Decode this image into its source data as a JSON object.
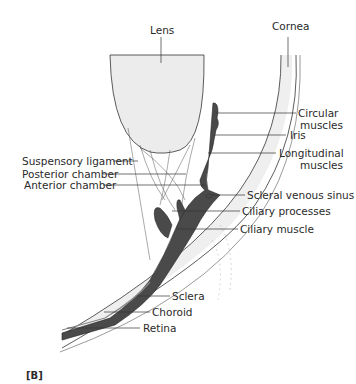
{
  "figure": {
    "panel_label": "[B]",
    "labels": {
      "lens": "Lens",
      "cornea": "Cornea",
      "circular_muscles_1": "Circular",
      "circular_muscles_2": "muscles",
      "iris": "Iris",
      "longitudinal_muscles_1": "Longitudinal",
      "longitudinal_muscles_2": "muscles",
      "suspensory_ligament": "Suspensory ligament",
      "posterior_chamber": "Posterior chamber",
      "anterior_chamber": "Anterior chamber",
      "scleral_venous_sinus": "Scleral venous sinus",
      "ciliary_processes": "Ciliary processes",
      "ciliary_muscle": "Ciliary muscle",
      "sclera": "Sclera",
      "choroid": "Choroid",
      "retina": "Retina"
    },
    "colors": {
      "tissue_dark": "#4a4a4a",
      "lens_fill": "#ececec",
      "sclera_fill": "#efefef",
      "line": "#333333"
    }
  }
}
